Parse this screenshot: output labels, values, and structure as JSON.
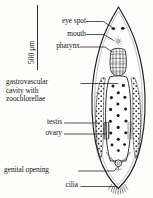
{
  "figure": {
    "kind": "anatomical-diagram",
    "background_color": "#fdfdfc",
    "ink_color": "#1a1a1a"
  },
  "scale": {
    "label": "500 μm",
    "orientation": "vertical"
  },
  "labels": {
    "eye_spot": "eye spot",
    "mouth": "mouth",
    "pharynx": "pharynx",
    "gastrovascular_line1": "gastrovascular",
    "gastrovascular_line2": "cavity with",
    "gastrovascular_line3": "zoochlorellae",
    "testis": "testis",
    "ovary": "ovary",
    "genital_opening": "genital opening",
    "cilia": "cilia"
  }
}
